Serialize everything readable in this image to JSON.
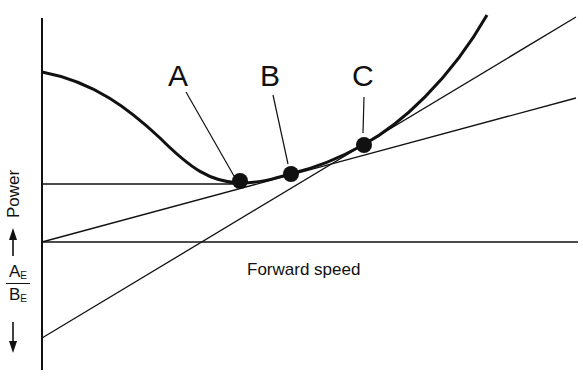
{
  "diagram": {
    "title": "",
    "points": [
      {
        "id": "A",
        "label": "A"
      },
      {
        "id": "B",
        "label": "B"
      },
      {
        "id": "C",
        "label": "C"
      }
    ],
    "x_axis_label": "Forward speed",
    "y_axis_label": "Power",
    "ratio_label": {
      "numerator": "A",
      "numerator_sub": "E",
      "denominator": "B",
      "denominator_sub": "E"
    },
    "colors": {
      "line": "#111111",
      "background": "#ffffff"
    }
  }
}
